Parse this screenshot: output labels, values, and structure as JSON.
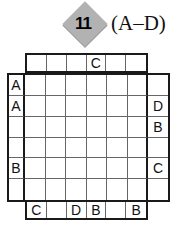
{
  "header": {
    "puzzle_number": "11",
    "letter_range": "(A–D)"
  },
  "puzzle": {
    "type": "easy-as-abc-grid",
    "rows": 6,
    "cols": 6,
    "top_clues": [
      "",
      "",
      "",
      "C",
      "",
      ""
    ],
    "bottom_clues": [
      "C",
      "",
      "D",
      "B",
      "",
      "B"
    ],
    "left_clues": [
      "A",
      "A",
      "",
      "",
      "B",
      ""
    ],
    "right_clues": [
      "",
      "D",
      "B",
      "",
      "C",
      ""
    ]
  },
  "colors": {
    "diamond": "#b2b2b2",
    "border": "#1a1a1a",
    "grid_line": "#666666",
    "text": "#111111",
    "background": "#ffffff"
  }
}
